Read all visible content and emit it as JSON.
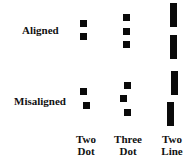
{
  "figure": {
    "row_labels": {
      "aligned": "Aligned",
      "misaligned": "Misaligned"
    },
    "column_labels": [
      {
        "line1": "Two",
        "line2": "Dot"
      },
      {
        "line1": "Three",
        "line2": "Dot"
      },
      {
        "line1": "Two",
        "line2": "Line"
      }
    ],
    "colors": {
      "shape": "#0a0a0a",
      "background": "#ffffff"
    },
    "stimuli": {
      "aligned": {
        "two_dot": [
          {
            "x": 80,
            "y": 20,
            "w": 7,
            "h": 7
          },
          {
            "x": 80,
            "y": 33,
            "w": 7,
            "h": 7
          }
        ],
        "three_dot": [
          {
            "x": 123,
            "y": 14,
            "w": 7,
            "h": 7
          },
          {
            "x": 123,
            "y": 28,
            "w": 7,
            "h": 7
          },
          {
            "x": 123,
            "y": 41,
            "w": 7,
            "h": 7
          }
        ],
        "two_line": [
          {
            "x": 170,
            "y": 3,
            "w": 7,
            "h": 24
          },
          {
            "x": 170,
            "y": 35,
            "w": 7,
            "h": 24
          }
        ]
      },
      "misaligned": {
        "two_dot": [
          {
            "x": 80,
            "y": 88,
            "w": 7,
            "h": 7
          },
          {
            "x": 83,
            "y": 102,
            "w": 7,
            "h": 7
          }
        ],
        "three_dot": [
          {
            "x": 124,
            "y": 82,
            "w": 7,
            "h": 7
          },
          {
            "x": 120,
            "y": 95,
            "w": 7,
            "h": 7
          },
          {
            "x": 124,
            "y": 109,
            "w": 7,
            "h": 7
          }
        ],
        "two_line": [
          {
            "x": 171,
            "y": 71,
            "w": 7,
            "h": 24
          },
          {
            "x": 167,
            "y": 102,
            "w": 7,
            "h": 24
          }
        ]
      }
    }
  }
}
